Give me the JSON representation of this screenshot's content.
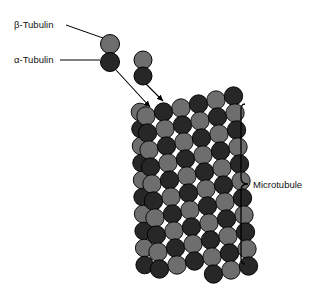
{
  "figure": {
    "title_visible": false,
    "background_color": "#ffffff",
    "width": 318,
    "height": 290
  },
  "labels": {
    "beta_tubulin": "β-Tubulin",
    "alpha_tubulin": "α-Tubulin",
    "microtubule": "Microtubule"
  },
  "colors": {
    "beta_subunit": "#6e6e6e",
    "alpha_subunit": "#272727",
    "outline": "#000000",
    "leader_line": "#000000",
    "text": "#111111"
  },
  "legend_dimers": [
    {
      "name": "labeled-dimer",
      "beta": {
        "cx": 110,
        "cy": 44,
        "r": 9.5,
        "color": "#6e6e6e"
      },
      "alpha": {
        "cx": 110,
        "cy": 62,
        "r": 9.5,
        "color": "#272727"
      }
    },
    {
      "name": "free-dimer",
      "beta": {
        "cx": 143,
        "cy": 60,
        "r": 9.0,
        "color": "#6e6e6e"
      },
      "alpha": {
        "cx": 143,
        "cy": 76,
        "r": 9.0,
        "color": "#272727"
      }
    }
  ],
  "leader_lines": [
    {
      "name": "beta-leader",
      "x1": 66,
      "y1": 25,
      "x2": 103,
      "y2": 38
    },
    {
      "name": "alpha-leader",
      "x1": 60,
      "y1": 60,
      "x2": 100,
      "y2": 60
    }
  ],
  "arrows": [
    {
      "name": "assembly-arrow-left",
      "x1": 116,
      "y1": 70,
      "x2": 150,
      "y2": 107
    },
    {
      "name": "assembly-arrow-right",
      "x1": 146,
      "y1": 84,
      "x2": 163,
      "y2": 101
    }
  ],
  "brace": {
    "name": "microtubule-brace",
    "x": 241,
    "y_top": 104,
    "y_bottom": 264,
    "y_mid": 184,
    "tip_x": 248
  },
  "microtubule": {
    "protofilament_count": 6,
    "subunits_per_protofilament": 11,
    "circle_radius": 9.2,
    "column_spacing": 17.5,
    "row_spacing": 17.0,
    "column_vertical_offset": -4.0,
    "origin_x": 146,
    "origin_y": 116,
    "tilt_dx_per_row": 1.5,
    "pattern": "alternating-alpha-beta",
    "back_column": {
      "present": true,
      "name": "rear-protofilament-edge",
      "origin_x": 140,
      "origin_y": 112
    }
  }
}
